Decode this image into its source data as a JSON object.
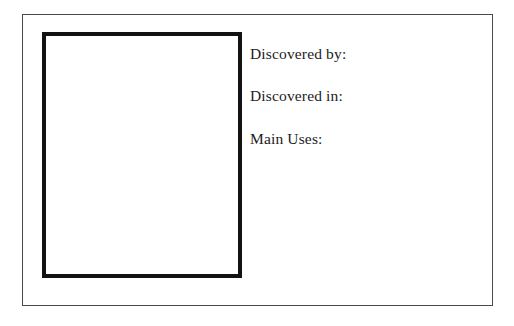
{
  "card": {
    "name": "discovery-info-card",
    "background_color": "#ffffff",
    "border_color": "#4a4a4a"
  },
  "picture_box": {
    "label": "",
    "border_color": "#121212",
    "fill_color": "#ffffff"
  },
  "fields": [
    {
      "label": "Discovered by:",
      "value": ""
    },
    {
      "label": "Discovered in:",
      "value": ""
    },
    {
      "label": "Main Uses:",
      "value": ""
    }
  ],
  "notes": {
    "value": ""
  },
  "colors": {
    "text": "#1c1c1c",
    "frame": "#4a4a4a",
    "box_rule": "#121212",
    "page": "#ffffff"
  }
}
